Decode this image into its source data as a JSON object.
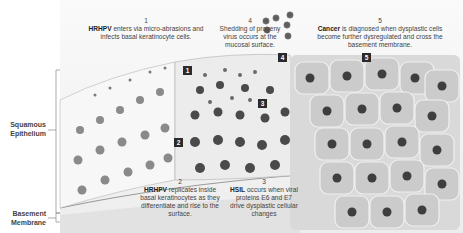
{
  "diagram": {
    "type": "illustration",
    "side_labels": {
      "squamous_epithelium": "Squamous Epithelium",
      "squamous_line1": "Squamous",
      "squamous_line2": "Epithelium",
      "basement_line1": "Basement",
      "basement_line2": "Membrane"
    },
    "steps": [
      {
        "number": "1",
        "bold": "HRHPV",
        "text": " enters via micro-abrasions and infects basal keratinocyte cells."
      },
      {
        "number": "2",
        "bold": "HRHPV",
        "text": " replicates inside basal keratinocytes as they differentiate and rise to the surface."
      },
      {
        "number": "3",
        "bold": "HSIL",
        "text": " occurs when viral proteins E6 and E7 drive dysplastic cellular changes"
      },
      {
        "number": "4",
        "bold": "",
        "text": "Shedding of progeny virus occurs at the mucosal surface."
      },
      {
        "number": "5",
        "bold": "Cancer",
        "text": " is diagnosed when dysplastic cells become further dysregulated and cross the basement membrane."
      }
    ],
    "markers": [
      "1",
      "2",
      "3",
      "4",
      "5"
    ],
    "colors": {
      "marker_bg": "#2a2a2a",
      "normal_cell": "#f4f4f4",
      "dysplastic_cell": "#d8d8d8",
      "cancer_cell": "#c9c9c9",
      "nucleus": "#5a5a5a",
      "virus": "#6b6b6b"
    }
  }
}
